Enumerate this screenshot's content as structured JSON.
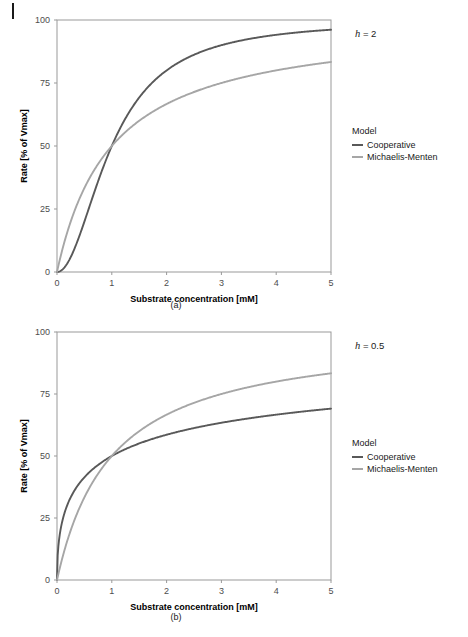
{
  "page": {
    "background": "#ffffff",
    "margin_mark": "page-edge-mark"
  },
  "colors": {
    "cooperative": "#595959",
    "michaelis_menten": "#a6a6a6",
    "panel_border": "#999999",
    "axis_text": "#4d4d4d",
    "title_text": "#000000"
  },
  "figures": [
    {
      "id": "a",
      "caption": "(a)",
      "facet_label_prefix": "h",
      "facet_label_value": " = 2",
      "legend": {
        "title": "Model",
        "entries": [
          {
            "label": "Cooperative",
            "color": "#595959"
          },
          {
            "label": "Michaelis-Menten",
            "color": "#a6a6a6"
          }
        ]
      }
    },
    {
      "id": "b",
      "caption": "(b)",
      "facet_label_prefix": "h",
      "facet_label_value": " = 0.5",
      "legend": {
        "title": "Model",
        "entries": [
          {
            "label": "Cooperative",
            "color": "#595959"
          },
          {
            "label": "Michaelis-Menten",
            "color": "#a6a6a6"
          }
        ]
      }
    }
  ],
  "chart_data": [
    {
      "type": "line",
      "id": "panel-a",
      "title": "",
      "annotation": "h = 2",
      "xlabel": "Substrate concentration [mM]",
      "ylabel": "Rate [% of Vmax]",
      "xlim": [
        0,
        5
      ],
      "ylim": [
        0,
        100
      ],
      "xticks": [
        0,
        1,
        2,
        3,
        4,
        5
      ],
      "yticks": [
        0,
        25,
        50,
        75,
        100
      ],
      "grid": false,
      "legend_position": "right",
      "legend_title": "Model",
      "series": [
        {
          "name": "Cooperative",
          "color": "#595959",
          "hill_coefficient": 2,
          "km": 1,
          "vmax_pct": 100,
          "x": [
            0,
            0.1,
            0.2,
            0.3,
            0.4,
            0.5,
            0.6,
            0.7,
            0.8,
            0.9,
            1,
            1.25,
            1.5,
            1.75,
            2,
            2.5,
            3,
            3.5,
            4,
            4.5,
            5
          ],
          "values": [
            0,
            1,
            3.8,
            8.3,
            13.8,
            20,
            26.5,
            32.9,
            39,
            44.8,
            50,
            61,
            69.2,
            75.4,
            80,
            86.2,
            90,
            92.5,
            94.1,
            95.3,
            96.2
          ]
        },
        {
          "name": "Michaelis-Menten",
          "color": "#a6a6a6",
          "hill_coefficient": 1,
          "km": 1,
          "vmax_pct": 100,
          "x": [
            0,
            0.1,
            0.2,
            0.3,
            0.4,
            0.5,
            0.6,
            0.7,
            0.8,
            0.9,
            1,
            1.25,
            1.5,
            1.75,
            2,
            2.5,
            3,
            3.5,
            4,
            4.5,
            5
          ],
          "values": [
            0,
            9.1,
            16.7,
            23.1,
            28.6,
            33.3,
            37.5,
            41.2,
            44.4,
            47.4,
            50,
            55.6,
            60,
            63.6,
            66.7,
            71.4,
            75,
            77.8,
            80,
            81.8,
            83.3
          ]
        }
      ]
    },
    {
      "type": "line",
      "id": "panel-b",
      "title": "",
      "annotation": "h = 0.5",
      "xlabel": "Substrate concentration [mM]",
      "ylabel": "Rate [% of Vmax]",
      "xlim": [
        0,
        5
      ],
      "ylim": [
        0,
        100
      ],
      "xticks": [
        0,
        1,
        2,
        3,
        4,
        5
      ],
      "yticks": [
        0,
        25,
        50,
        75,
        100
      ],
      "grid": false,
      "legend_position": "right",
      "legend_title": "Model",
      "series": [
        {
          "name": "Cooperative",
          "color": "#595959",
          "hill_coefficient": 0.5,
          "km": 1,
          "vmax_pct": 100,
          "x": [
            0,
            0.05,
            0.1,
            0.2,
            0.3,
            0.4,
            0.5,
            0.6,
            0.8,
            1,
            1.5,
            2,
            2.5,
            3,
            3.5,
            4,
            4.5,
            5
          ],
          "values": [
            0,
            18.3,
            24.0,
            30.9,
            35.4,
            38.7,
            41.4,
            43.6,
            47.2,
            50,
            55.1,
            58.6,
            61.3,
            63.4,
            65.2,
            66.7,
            68.0,
            69.1
          ]
        },
        {
          "name": "Michaelis-Menten",
          "color": "#a6a6a6",
          "hill_coefficient": 1,
          "km": 1,
          "vmax_pct": 100,
          "x": [
            0,
            0.05,
            0.1,
            0.2,
            0.3,
            0.4,
            0.5,
            0.6,
            0.8,
            1,
            1.5,
            2,
            2.5,
            3,
            3.5,
            4,
            4.5,
            5
          ],
          "values": [
            0,
            4.8,
            9.1,
            16.7,
            23.1,
            28.6,
            33.3,
            37.5,
            44.4,
            50,
            60,
            66.7,
            71.4,
            75,
            77.8,
            80,
            81.8,
            83.3
          ]
        }
      ]
    }
  ]
}
